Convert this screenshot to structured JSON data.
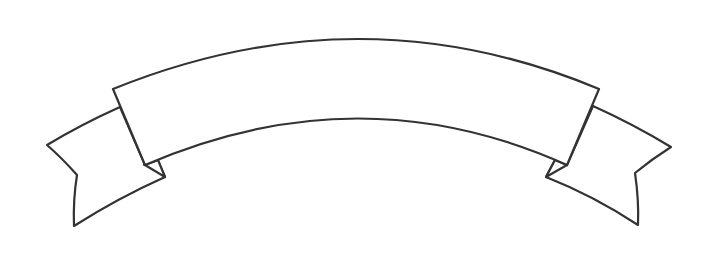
{
  "image": {
    "subject": "blank curved ribbon banner line drawing",
    "colors": {
      "background": "#ffffff",
      "outline": "#333333",
      "fill": "#ffffff"
    }
  },
  "banner": {
    "text": ""
  }
}
